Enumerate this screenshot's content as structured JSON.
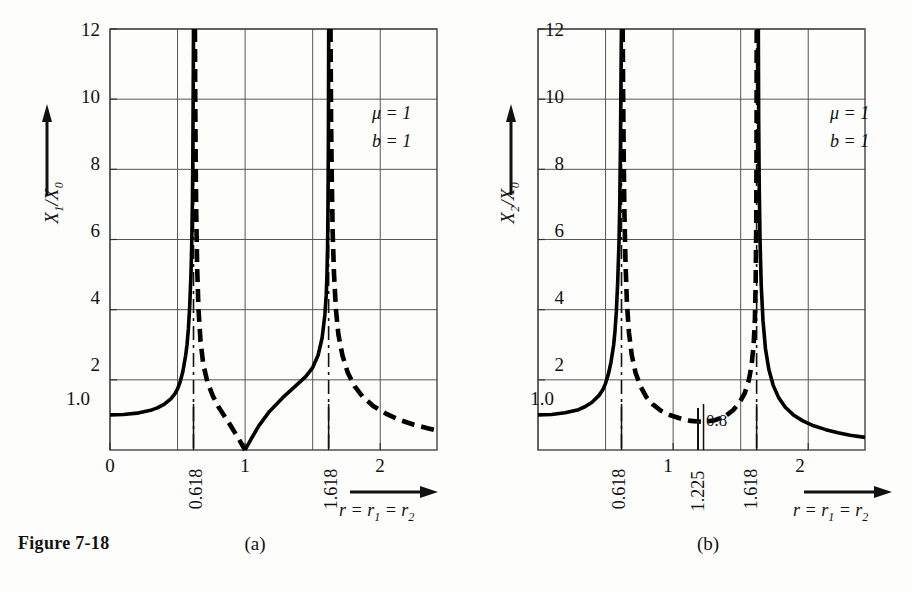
{
  "figure": {
    "caption": "Figure 7-18",
    "panels": [
      {
        "id": "a",
        "letter": "(a)",
        "ylabel_main": "X",
        "ylabel_sub1": "1",
        "ylabel_slash": "/X",
        "ylabel_sub2": "0",
        "params": {
          "mu": "μ = 1",
          "b": "b = 1"
        },
        "xaxis_caption_r": "r",
        "xaxis_caption_eq1": " = r",
        "xaxis_caption_sub1": "1",
        "xaxis_caption_eq2": " = r",
        "xaxis_caption_sub2": "2",
        "ytick_labels": [
          "12",
          "10",
          "8",
          "6",
          "4",
          "2",
          "1.0"
        ],
        "xtick_labels": [
          "0",
          "1",
          "2"
        ],
        "xtick_rot_labels": [
          "0.618",
          "1.618"
        ],
        "annotation": ""
      },
      {
        "id": "b",
        "letter": "(b)",
        "ylabel_main": "X",
        "ylabel_sub1": "2",
        "ylabel_slash": "/X",
        "ylabel_sub2": "0",
        "params": {
          "mu": "μ = 1",
          "b": "b = 1"
        },
        "xaxis_caption_r": "r",
        "xaxis_caption_eq1": " = r",
        "xaxis_caption_sub1": "1",
        "xaxis_caption_eq2": " = r",
        "xaxis_caption_sub2": "2",
        "ytick_labels": [
          "12",
          "10",
          "8",
          "6",
          "4",
          "2",
          "1.0"
        ],
        "xtick_labels": [
          "1",
          "2"
        ],
        "xtick_rot_labels": [
          "0.618",
          "1.225",
          "1.618"
        ],
        "annotation": "0.8"
      }
    ]
  },
  "chart_data": [
    {
      "type": "line",
      "panel": "a",
      "title": "Figure 7-18 (a)",
      "xlabel": "r = r1 = r2",
      "ylabel": "X1/X0",
      "xlim": [
        0,
        2.42
      ],
      "ylim": [
        0,
        12
      ],
      "grid": true,
      "grid_x": [
        0,
        0.5,
        1.0,
        1.5,
        2.0
      ],
      "grid_y": [
        2,
        4,
        6,
        8,
        10,
        12
      ],
      "yticks": [
        1.0,
        2,
        4,
        6,
        8,
        10,
        12
      ],
      "xticks": [
        0,
        1,
        2
      ],
      "special_xticks": [
        0.618,
        1.618
      ],
      "asymptotes": [
        0.618,
        1.618
      ],
      "annotations": [
        {
          "text": "μ = 1",
          "x": 2.1,
          "y": 9.3
        },
        {
          "text": "b = 1",
          "x": 2.1,
          "y": 8.6
        }
      ],
      "series": [
        {
          "name": "solid-branch-1",
          "style": "solid",
          "points": [
            [
              0.0,
              1.0
            ],
            [
              0.1,
              1.01
            ],
            [
              0.2,
              1.05
            ],
            [
              0.3,
              1.13
            ],
            [
              0.35,
              1.2
            ],
            [
              0.4,
              1.3
            ],
            [
              0.45,
              1.46
            ],
            [
              0.48,
              1.6
            ],
            [
              0.5,
              1.74
            ],
            [
              0.52,
              1.95
            ],
            [
              0.54,
              2.25
            ],
            [
              0.56,
              2.7
            ],
            [
              0.57,
              3.0
            ],
            [
              0.58,
              3.45
            ],
            [
              0.59,
              4.1
            ],
            [
              0.6,
              5.1
            ],
            [
              0.605,
              5.9
            ],
            [
              0.61,
              7.1
            ],
            [
              0.613,
              8.3
            ],
            [
              0.616,
              10.5
            ],
            [
              0.618,
              12.0
            ]
          ]
        },
        {
          "name": "dashed-branch-1",
          "style": "dashed",
          "points": [
            [
              0.6285,
              12.0
            ],
            [
              0.631,
              10.0
            ],
            [
              0.634,
              8.3
            ],
            [
              0.638,
              6.8
            ],
            [
              0.645,
              5.2
            ],
            [
              0.655,
              4.0
            ],
            [
              0.67,
              3.1
            ],
            [
              0.69,
              2.45
            ],
            [
              0.72,
              1.95
            ],
            [
              0.76,
              1.55
            ],
            [
              0.8,
              1.25
            ],
            [
              0.85,
              0.95
            ],
            [
              0.9,
              0.65
            ],
            [
              0.95,
              0.33
            ],
            [
              1.0,
              0.0
            ]
          ]
        },
        {
          "name": "solid-branch-2",
          "style": "solid",
          "points": [
            [
              1.0,
              0.0
            ],
            [
              1.05,
              0.35
            ],
            [
              1.1,
              0.68
            ],
            [
              1.18,
              1.1
            ],
            [
              1.28,
              1.5
            ],
            [
              1.38,
              1.85
            ],
            [
              1.45,
              2.1
            ],
            [
              1.5,
              2.35
            ],
            [
              1.54,
              2.7
            ],
            [
              1.57,
              3.2
            ],
            [
              1.59,
              3.85
            ],
            [
              1.6,
              4.4
            ],
            [
              1.605,
              4.9
            ],
            [
              1.61,
              5.8
            ],
            [
              1.613,
              6.8
            ],
            [
              1.616,
              8.6
            ],
            [
              1.6185,
              12.0
            ]
          ]
        },
        {
          "name": "dashed-branch-2",
          "style": "dashed",
          "points": [
            [
              1.632,
              12.0
            ],
            [
              1.636,
              9.5
            ],
            [
              1.641,
              7.8
            ],
            [
              1.648,
              6.2
            ],
            [
              1.658,
              5.0
            ],
            [
              1.672,
              4.0
            ],
            [
              1.69,
              3.3
            ],
            [
              1.72,
              2.7
            ],
            [
              1.76,
              2.2
            ],
            [
              1.81,
              1.82
            ],
            [
              1.87,
              1.52
            ],
            [
              1.95,
              1.25
            ],
            [
              2.05,
              1.02
            ],
            [
              2.15,
              0.85
            ],
            [
              2.25,
              0.72
            ],
            [
              2.35,
              0.62
            ],
            [
              2.42,
              0.56
            ]
          ]
        }
      ]
    },
    {
      "type": "line",
      "panel": "b",
      "title": "Figure 7-18 (b)",
      "xlabel": "r = r1 = r2",
      "ylabel": "X2/X0",
      "xlim": [
        0,
        2.42
      ],
      "ylim": [
        0,
        12
      ],
      "grid": true,
      "grid_x": [
        0,
        0.5,
        1.0,
        1.5,
        2.0
      ],
      "grid_y": [
        2,
        4,
        6,
        8,
        10,
        12
      ],
      "yticks": [
        1.0,
        2,
        4,
        6,
        8,
        10,
        12
      ],
      "xticks": [
        1,
        2
      ],
      "special_xticks": [
        0.618,
        1.225,
        1.618
      ],
      "asymptotes": [
        0.618,
        1.618
      ],
      "minimum": {
        "x": 1.225,
        "y": 0.8
      },
      "annotations": [
        {
          "text": "μ = 1",
          "x": 2.1,
          "y": 9.3
        },
        {
          "text": "b = 1",
          "x": 2.1,
          "y": 8.6
        },
        {
          "text": "0.8",
          "x": 1.27,
          "y": 0.55
        }
      ],
      "series": [
        {
          "name": "solid-branch-1",
          "style": "solid",
          "points": [
            [
              0.0,
              1.0
            ],
            [
              0.1,
              1.01
            ],
            [
              0.2,
              1.06
            ],
            [
              0.3,
              1.15
            ],
            [
              0.35,
              1.24
            ],
            [
              0.4,
              1.36
            ],
            [
              0.45,
              1.55
            ],
            [
              0.48,
              1.72
            ],
            [
              0.5,
              1.9
            ],
            [
              0.52,
              2.15
            ],
            [
              0.54,
              2.5
            ],
            [
              0.56,
              3.0
            ],
            [
              0.57,
              3.4
            ],
            [
              0.58,
              3.95
            ],
            [
              0.59,
              4.8
            ],
            [
              0.6,
              6.0
            ],
            [
              0.605,
              7.0
            ],
            [
              0.61,
              8.6
            ],
            [
              0.613,
              10.0
            ],
            [
              0.616,
              11.4
            ],
            [
              0.6175,
              12.0
            ]
          ]
        },
        {
          "name": "dashed-branch-1",
          "style": "dashed",
          "points": [
            [
              0.627,
              12.0
            ],
            [
              0.63,
              10.2
            ],
            [
              0.634,
              8.5
            ],
            [
              0.639,
              6.9
            ],
            [
              0.647,
              5.4
            ],
            [
              0.658,
              4.2
            ],
            [
              0.673,
              3.35
            ],
            [
              0.694,
              2.7
            ],
            [
              0.722,
              2.2
            ],
            [
              0.758,
              1.82
            ],
            [
              0.8,
              1.52
            ],
            [
              0.85,
              1.3
            ],
            [
              0.91,
              1.12
            ],
            [
              0.98,
              0.99
            ],
            [
              1.06,
              0.89
            ],
            [
              1.13,
              0.83
            ],
            [
              1.225,
              0.8
            ],
            [
              1.31,
              0.85
            ],
            [
              1.38,
              0.95
            ],
            [
              1.44,
              1.12
            ],
            [
              1.49,
              1.34
            ],
            [
              1.53,
              1.62
            ],
            [
              1.56,
              1.98
            ],
            [
              1.58,
              2.4
            ],
            [
              1.595,
              2.95
            ],
            [
              1.605,
              3.7
            ],
            [
              1.611,
              4.8
            ],
            [
              1.615,
              6.4
            ],
            [
              1.6175,
              9.0
            ],
            [
              1.6185,
              12.0
            ]
          ]
        },
        {
          "name": "solid-branch-2",
          "style": "solid",
          "points": [
            [
              1.6305,
              12.0
            ],
            [
              1.633,
              9.5
            ],
            [
              1.637,
              7.6
            ],
            [
              1.643,
              6.0
            ],
            [
              1.652,
              4.7
            ],
            [
              1.665,
              3.7
            ],
            [
              1.683,
              2.9
            ],
            [
              1.708,
              2.3
            ],
            [
              1.74,
              1.85
            ],
            [
              1.78,
              1.5
            ],
            [
              1.83,
              1.22
            ],
            [
              1.89,
              1.0
            ],
            [
              1.96,
              0.83
            ],
            [
              2.04,
              0.69
            ],
            [
              2.13,
              0.58
            ],
            [
              2.22,
              0.49
            ],
            [
              2.31,
              0.42
            ],
            [
              2.42,
              0.36
            ]
          ]
        }
      ]
    }
  ]
}
